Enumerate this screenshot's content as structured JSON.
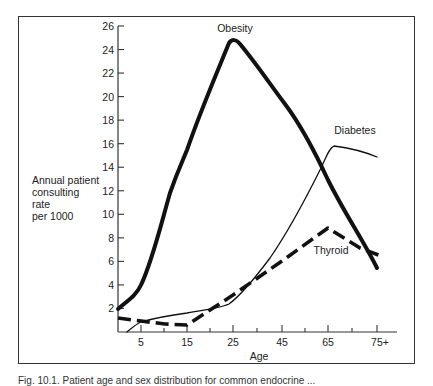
{
  "chart_data": {
    "type": "line",
    "title": "",
    "xlabel": "Age",
    "ylabel": "Annual patient consulting rate per 1000",
    "x_tick_labels": [
      "5",
      "15",
      "25",
      "45",
      "65",
      "75+"
    ],
    "y_tick_labels": [
      "2",
      "4",
      "6",
      "8",
      "10",
      "12",
      "14",
      "16",
      "18",
      "20",
      "22",
      "24",
      "26"
    ],
    "ylim": [
      0,
      26
    ],
    "grid": false,
    "legend": "inline labels",
    "x": [
      "0",
      "5",
      "15",
      "25",
      "45",
      "65",
      "75+"
    ],
    "series": [
      {
        "name": "Obesity",
        "style": "thick solid",
        "values": [
          2.0,
          4.0,
          15.4,
          24.7,
          19.7,
          12.9,
          5.4
        ]
      },
      {
        "name": "Diabetes",
        "style": "thin solid",
        "values": [
          0.0,
          0.8,
          1.6,
          2.3,
          7.8,
          15.8,
          14.9
        ]
      },
      {
        "name": "Thyroid",
        "style": "thick dashed",
        "values": [
          1.2,
          0.9,
          0.6,
          3.1,
          6.1,
          8.8,
          6.5
        ]
      }
    ],
    "annotations": [
      "Obesity",
      "Diabetes",
      "Thyroid"
    ]
  },
  "labels": {
    "obesity": "Obesity",
    "diabetes": "Diabetes",
    "thyroid": "Thyroid",
    "x_axis": "Age",
    "y_axis": "Annual patient\nconsulting\nrate\nper 1000"
  },
  "caption": "Fig. 10.1. Patient age and sex distribution for common endocrine ..."
}
